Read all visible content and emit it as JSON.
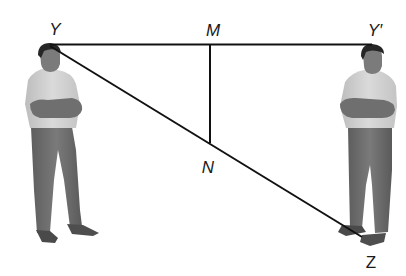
{
  "diagram": {
    "type": "geometry-figure",
    "points": {
      "Y": {
        "label": "Y",
        "x": 50,
        "y": 45
      },
      "M": {
        "label": "M",
        "x": 210,
        "y": 45
      },
      "Yp": {
        "label": "Y′",
        "x": 370,
        "y": 45
      },
      "N": {
        "label": "N",
        "x": 210,
        "y": 143
      },
      "Z": {
        "label": "Z",
        "x": 362,
        "y": 237
      }
    },
    "segments": [
      {
        "name": "YY'",
        "from": "Y",
        "to": "Yp"
      },
      {
        "name": "YZ",
        "from": "Y",
        "to": "Z"
      },
      {
        "name": "MN",
        "from": "M",
        "to": "N"
      }
    ],
    "figures": [
      {
        "name": "left-man",
        "pose": "arms-crossed"
      },
      {
        "name": "right-man",
        "pose": "arms-crossed"
      }
    ],
    "colors": {
      "line": "#111111",
      "shirt": "#cfcfcf",
      "pants": "#6e6e6e",
      "skin": "#777777",
      "hair": "#2b2b2b",
      "shoes": "#4a4a4a"
    }
  }
}
